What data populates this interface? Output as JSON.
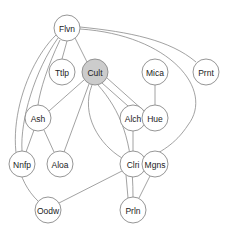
{
  "graph": {
    "node_radius": 13,
    "highlight_color": "#cccccc",
    "nodes": [
      {
        "id": "Flvn",
        "label": "Flvn",
        "x": 67,
        "y": 28,
        "highlight": false
      },
      {
        "id": "Ttlp",
        "label": "Ttlp",
        "x": 62,
        "y": 72,
        "highlight": false
      },
      {
        "id": "Cult",
        "label": "Cult",
        "x": 95,
        "y": 72,
        "highlight": true
      },
      {
        "id": "Mica",
        "label": "Mica",
        "x": 155,
        "y": 72,
        "highlight": false
      },
      {
        "id": "Prnt",
        "label": "Prnt",
        "x": 206,
        "y": 72,
        "highlight": false
      },
      {
        "id": "Ash",
        "label": "Ash",
        "x": 38,
        "y": 118,
        "highlight": false
      },
      {
        "id": "Alch",
        "label": "Alch",
        "x": 133,
        "y": 118,
        "highlight": false
      },
      {
        "id": "Hue",
        "label": "Hue",
        "x": 155,
        "y": 118,
        "highlight": false
      },
      {
        "id": "Nnfp",
        "label": "Nnfp",
        "x": 22,
        "y": 164,
        "highlight": false
      },
      {
        "id": "Aloa",
        "label": "Aloa",
        "x": 60,
        "y": 164,
        "highlight": false
      },
      {
        "id": "Clri",
        "label": "Clri",
        "x": 133,
        "y": 164,
        "highlight": false
      },
      {
        "id": "Mgns",
        "label": "Mgns",
        "x": 155,
        "y": 164,
        "highlight": false
      },
      {
        "id": "Oodw",
        "label": "Oodw",
        "x": 48,
        "y": 210,
        "highlight": false
      },
      {
        "id": "Prln",
        "label": "Prln",
        "x": 133,
        "y": 210,
        "highlight": false
      }
    ],
    "edges": [
      {
        "from": "Flvn",
        "to": "Ttlp",
        "path": "M67,41 L62,59"
      },
      {
        "from": "Flvn",
        "to": "Cult",
        "path": "M75,38 L87,62"
      },
      {
        "from": "Flvn",
        "to": "Ash",
        "path": "M60,40 C48,65 40,90 38,105"
      },
      {
        "from": "Flvn",
        "to": "Nnfp",
        "path": "M58,38 C35,70 20,120 22,151"
      },
      {
        "from": "Flvn",
        "to": "Oodw",
        "path": "M56,35 C20,70 -5,160 38,201"
      },
      {
        "from": "Flvn",
        "to": "Prnt",
        "path": "M80,27 C130,32 170,40 196,62"
      },
      {
        "from": "Flvn",
        "to": "Clri",
        "path": "M80,29 C170,35 215,90 188,125 C175,145 160,152 145,160"
      },
      {
        "from": "Cult",
        "to": "Ash",
        "path": "M84,80 L49,111"
      },
      {
        "from": "Cult",
        "to": "Aloa",
        "path": "M89,84 L64,152"
      },
      {
        "from": "Cult",
        "to": "Alch",
        "path": "M102,83 L128,106"
      },
      {
        "from": "Cult",
        "to": "Hue",
        "path": "M107,78 L144,111"
      },
      {
        "from": "Cult",
        "to": "Clri",
        "path": "M92,85 C80,115 100,145 122,158"
      },
      {
        "from": "Cult",
        "to": "Prln",
        "path": "M98,85 C120,110 133,140 133,197"
      },
      {
        "from": "Mica",
        "to": "Hue",
        "path": "M155,85 L155,105"
      },
      {
        "from": "Ash",
        "to": "Nnfp",
        "path": "M34,130 L26,152"
      },
      {
        "from": "Ash",
        "to": "Aloa",
        "path": "M44,130 L54,152"
      },
      {
        "from": "Alch",
        "to": "Clri",
        "path": "M133,131 L133,151"
      },
      {
        "from": "Clri",
        "to": "Oodw",
        "path": "M122,171 L59,203"
      },
      {
        "from": "Clri",
        "to": "Prln",
        "path": "M126,175 L128,198"
      },
      {
        "from": "Mgns",
        "to": "Prln",
        "path": "M150,176 L139,198"
      }
    ]
  }
}
